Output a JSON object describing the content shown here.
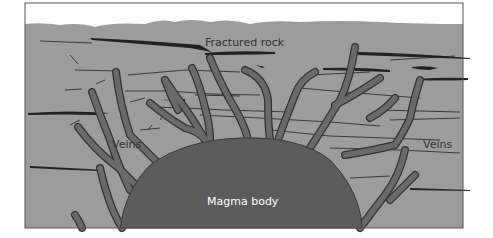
{
  "diagram": {
    "labels": {
      "fractured_rock": "Fractured rock",
      "veins_left": "Veins",
      "veins_right": "Veins",
      "magma_body": "Magma body"
    },
    "colors": {
      "sky": "#ffffff",
      "rock": "#9c9c9c",
      "magma": "#5c5c5c",
      "vein_fill": "#6a6a6a",
      "vein_outline": "#3a3a3a",
      "fracture": "#2a2a2a",
      "frame": "#555555",
      "label_dark": "#333333",
      "label_light": "#ffffff"
    }
  }
}
